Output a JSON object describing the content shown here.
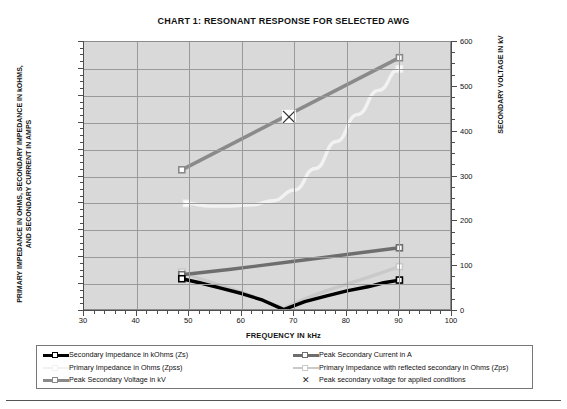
{
  "chart_data": {
    "type": "line",
    "title": "CHART 1:  RESONANT RESPONSE FOR SELECTED AWG",
    "xlabel": "FREQUENCY IN kHz",
    "ylabel": "PRIMARY IMPEDANCE IN OHMS, SECONDARY IMPEDANCE IN kOHMS, AND SECONDARY CURRENT IN AMPS",
    "ylabel_right": "SECONDARY VOLTAGE IN kV",
    "xlim": [
      30,
      100
    ],
    "ylim": [
      0,
      200
    ],
    "ylim_right": [
      0,
      600
    ],
    "xticks": [
      30,
      40,
      50,
      60,
      70,
      80,
      90,
      100
    ],
    "yticks": [
      0,
      20,
      40,
      60,
      80,
      100,
      120,
      140,
      160,
      180,
      200
    ],
    "yticks_right": [
      0,
      100,
      200,
      300,
      400,
      500,
      600
    ],
    "x_minor_step": 2,
    "grid": true,
    "legend_position": "below-plot",
    "plot_background": "#d9d9d9",
    "series": [
      {
        "name": "Secondary Impedance in kOhms (Zs)",
        "color": "#000000",
        "axis": "left",
        "marker": "square",
        "x": [
          48.6,
          52,
          56,
          60,
          64,
          68,
          72,
          76,
          80,
          84,
          87,
          90
        ],
        "values": [
          24,
          21,
          17,
          13,
          8,
          1,
          7,
          11,
          15,
          18,
          21,
          23
        ]
      },
      {
        "name": "Primary Impedance in Ohms (Zpss)",
        "color": "#f2f2f2",
        "axis": "left",
        "marker": "square",
        "x": [
          49.5,
          54,
          58,
          62,
          66,
          70,
          74,
          78,
          82,
          86,
          90
        ],
        "values": [
          80,
          78,
          78,
          79,
          82,
          90,
          106,
          126,
          146,
          164,
          180
        ]
      },
      {
        "name": "Peak Secondary Voltage in kV",
        "color": "#8a8a8a",
        "axis": "right",
        "marker": "square",
        "x": [
          48.6,
          90
        ],
        "values": [
          315,
          565
        ]
      },
      {
        "name": "Peak Secondary Current in A",
        "color": "#6e6e6e",
        "axis": "left",
        "marker": "square",
        "x": [
          48.6,
          58,
          70,
          80,
          90
        ],
        "values": [
          27,
          31,
          37,
          42,
          47
        ]
      },
      {
        "name": "Primary Impedance with reflected secondary in Ohms (Zps)",
        "color": "#c9c9c9",
        "axis": "left",
        "marker": "square",
        "x": [
          48.6,
          52,
          56,
          60,
          64,
          68,
          72,
          76,
          80,
          84,
          87,
          90
        ],
        "values": [
          29,
          24,
          19,
          14,
          8,
          2,
          9,
          15,
          20,
          25,
          29,
          33
        ]
      },
      {
        "name": "Peak secondary voltage for applied conditions",
        "color": "#333333",
        "axis": "right",
        "marker": "x",
        "x": [
          69
        ],
        "values": [
          433
        ]
      }
    ],
    "annotations": [
      {
        "marker": "x-cross",
        "x": 69,
        "y_right": 433,
        "label": "Peak secondary voltage for applied conditions"
      }
    ]
  },
  "legend": {
    "entries": [
      {
        "label": "Secondary Impedance in kOhms (Zs)",
        "color": "#000000",
        "key": "line-marker",
        "column": 1
      },
      {
        "label": "Primary Impedance in Ohms (Zpss)",
        "color": "#f2f2f2",
        "key": "line-marker",
        "column": 1
      },
      {
        "label": "Peak Secondary Voltage in kV",
        "color": "#8a8a8a",
        "key": "line-marker",
        "column": 1
      },
      {
        "label": "Peak Secondary Current in A",
        "color": "#6e6e6e",
        "key": "line-marker",
        "column": 2
      },
      {
        "label": "Primary Impedance with reflected secondary in Ohms (Zps)",
        "color": "#c9c9c9",
        "key": "line-marker",
        "column": 2
      },
      {
        "label": "Peak secondary voltage for applied conditions",
        "color": "#333333",
        "key": "x-marker",
        "column": 2
      }
    ]
  }
}
